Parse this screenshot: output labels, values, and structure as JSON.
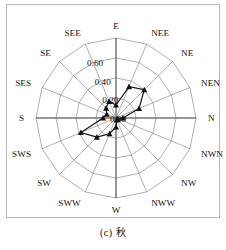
{
  "caption": "(c) 秋",
  "chart_data": {
    "type": "radar",
    "title": "",
    "subtitle": "",
    "xlabel": "",
    "ylabel": "",
    "grid": true,
    "legend_position": "none",
    "rlim": [
      0.0,
      0.8
    ],
    "rticks": [
      0.0,
      0.2,
      0.4,
      0.6
    ],
    "rtick_labels": [
      "0.00",
      "0.20",
      "0.40",
      "0.60"
    ],
    "rtick_angle_deg": 112.5,
    "start_angle_deg": 90,
    "direction": "clockwise",
    "categories": [
      "E",
      "NEE",
      "NE",
      "NEN",
      "N",
      "NWN",
      "NW",
      "NWW",
      "W",
      "SWW",
      "SW",
      "SWS",
      "S",
      "SES",
      "SE",
      "SEE"
    ],
    "series": [
      {
        "name": "autumn",
        "marker": "triangle",
        "color": "#111111",
        "values": [
          0.13,
          0.34,
          0.4,
          0.25,
          0.07,
          0.02,
          0.02,
          0.02,
          0.09,
          0.17,
          0.27,
          0.38,
          0.13,
          0.1,
          0.14,
          0.18
        ]
      }
    ]
  },
  "geometry": {
    "cx": 116,
    "cy": 118,
    "r_outer": 80,
    "rings": 4,
    "spokes": 16
  }
}
